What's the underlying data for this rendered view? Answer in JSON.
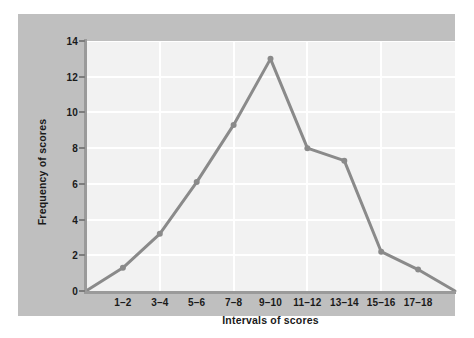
{
  "chart_data": {
    "type": "line",
    "title": "",
    "subtitle": "",
    "xlabel": "Intervals of scores",
    "ylabel": "Frequency of scores",
    "categories": [
      "1–2",
      "3–4",
      "5–6",
      "7–8",
      "9–10",
      "11–12",
      "13–14",
      "15–16",
      "17–18"
    ],
    "values": [
      1.3,
      3.2,
      6.1,
      9.3,
      13.0,
      8.0,
      7.3,
      2.2,
      1.2
    ],
    "series": [
      {
        "name": "Frequency of scores",
        "values": [
          1.3,
          3.2,
          6.1,
          9.3,
          13.0,
          8.0,
          7.3,
          2.2,
          1.2
        ]
      }
    ],
    "anchor_start": {
      "x_offset_categories": -1,
      "y": 0
    },
    "anchor_end": {
      "x_offset_categories": 1,
      "y": 0
    },
    "ylim": [
      0,
      14
    ],
    "yticks": [
      0,
      2,
      4,
      6,
      8,
      10,
      12,
      14
    ],
    "ytick_labels": [
      "0",
      "2",
      "4",
      "6",
      "8",
      "10",
      "12",
      "14"
    ],
    "xtick_labels": [
      "1–2",
      "3–4",
      "5–6",
      "7–8",
      "9–10",
      "11–12",
      "13–14",
      "15–16",
      "17–18"
    ],
    "grid": {
      "horizontal": true,
      "vertical": true,
      "color": "#ffffff"
    },
    "legend": {
      "visible": false,
      "position": "none"
    },
    "markers": true,
    "colors": {
      "line": "#8a8a8a",
      "marker": "#8a8a8a",
      "plot_background": "#f2f2f2",
      "panel_background": "#bfbfbf",
      "page_background": "#ffffff",
      "axis": "#9a9a9a",
      "text": "#1a1a1a",
      "gridline": "#ffffff"
    },
    "chart_kind_note": "frequency polygon"
  }
}
